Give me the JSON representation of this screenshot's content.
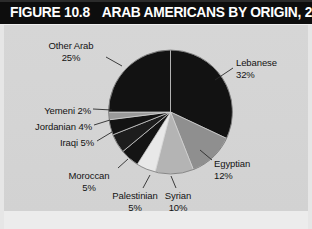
{
  "figure": {
    "number_label": "FIGURE 10.8",
    "headline": "ARAB AMERICANS BY ORIGIN, 2010"
  },
  "colors": {
    "title_bar_bg": "#0d0d0d",
    "title_text": "#ffffff",
    "panel_bg": "#d4d4d4",
    "label_text": "#131313",
    "slice_black": "#121212",
    "slice_dark": "#1c1c1c",
    "slice_mid_gray": "#8f8f8f",
    "slice_light_gray": "#b4b4b4",
    "slice_pale": "#e8e8e8",
    "leader_line": "#2a2a2a"
  },
  "chart_data": {
    "type": "pie",
    "title": "ARAB AMERICANS BY ORIGIN, 2010",
    "xlabel": "",
    "ylabel": "",
    "legend_position": "none",
    "grid": false,
    "categories": [
      "Lebanese",
      "Egyptian",
      "Syrian",
      "Palestinian",
      "Moroccan",
      "Iraqi",
      "Jordanian",
      "Yemeni",
      "Other Arab"
    ],
    "values": [
      32,
      12,
      10,
      5,
      5,
      5,
      4,
      2,
      25
    ],
    "value_unit": "%",
    "slices": [
      {
        "name": "Lebanese",
        "value": 32,
        "label": "Lebanese",
        "pct_label": "32%",
        "color": "#121212",
        "start_deg": 0,
        "end_deg": 115.2
      },
      {
        "name": "Egyptian",
        "value": 12,
        "label": "Egyptian",
        "pct_label": "12%",
        "color": "#8f8f8f",
        "start_deg": 115.2,
        "end_deg": 158.4
      },
      {
        "name": "Syrian",
        "value": 10,
        "label": "Syrian",
        "pct_label": "10%",
        "color": "#b4b4b4",
        "start_deg": 158.4,
        "end_deg": 194.4
      },
      {
        "name": "Palestinian",
        "value": 5,
        "label": "Palestinian",
        "pct_label": "5%",
        "color": "#e8e8e8",
        "start_deg": 194.4,
        "end_deg": 212.4
      },
      {
        "name": "Moroccan",
        "value": 5,
        "label": "Moroccan",
        "pct_label": "5%",
        "color": "#141414",
        "start_deg": 212.4,
        "end_deg": 230.4
      },
      {
        "name": "Iraqi",
        "value": 5,
        "label": "Iraqi 5%",
        "pct_label": "5%",
        "color": "#1d1d1d",
        "start_deg": 230.4,
        "end_deg": 248.4
      },
      {
        "name": "Jordanian",
        "value": 4,
        "label": "Jordanian 4%",
        "pct_label": "4%",
        "color": "#131313",
        "start_deg": 248.4,
        "end_deg": 262.8
      },
      {
        "name": "Yemeni",
        "value": 2,
        "label": "Yemeni 2%",
        "pct_label": "2%",
        "color": "#9a9a9a",
        "start_deg": 262.8,
        "end_deg": 270.0
      },
      {
        "name": "Other Arab",
        "value": 25,
        "label": "Other Arab",
        "pct_label": "25%",
        "color": "#121212",
        "start_deg": 270.0,
        "end_deg": 360.0
      }
    ]
  },
  "labels": {
    "lebanese": {
      "name": "Lebanese",
      "pct": "32%"
    },
    "egyptian": {
      "name": "Egyptian",
      "pct": "12%"
    },
    "syrian": {
      "name": "Syrian",
      "pct": "10%"
    },
    "palestinian": {
      "name": "Palestinian",
      "pct": "5%"
    },
    "moroccan": {
      "name": "Moroccan",
      "pct": "5%"
    },
    "iraqi": {
      "text": "Iraqi 5%"
    },
    "jordanian": {
      "text": "Jordanian 4%"
    },
    "yemeni": {
      "text": "Yemeni 2%"
    },
    "other_arab": {
      "name": "Other Arab",
      "pct": "25%"
    }
  }
}
